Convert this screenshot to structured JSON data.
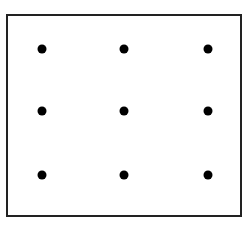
{
  "diagram": {
    "type": "dot-grid",
    "rows": 3,
    "columns": 3,
    "dot_color": "#000000",
    "border_color": "#222222",
    "dots": [
      {
        "row": 1,
        "col": 1,
        "x": 42,
        "y": 49
      },
      {
        "row": 1,
        "col": 2,
        "x": 124,
        "y": 49
      },
      {
        "row": 1,
        "col": 3,
        "x": 208,
        "y": 49
      },
      {
        "row": 2,
        "col": 1,
        "x": 42,
        "y": 111
      },
      {
        "row": 2,
        "col": 2,
        "x": 124,
        "y": 111
      },
      {
        "row": 2,
        "col": 3,
        "x": 208,
        "y": 111
      },
      {
        "row": 3,
        "col": 1,
        "x": 42,
        "y": 175
      },
      {
        "row": 3,
        "col": 2,
        "x": 124,
        "y": 175
      },
      {
        "row": 3,
        "col": 3,
        "x": 208,
        "y": 175
      }
    ]
  }
}
